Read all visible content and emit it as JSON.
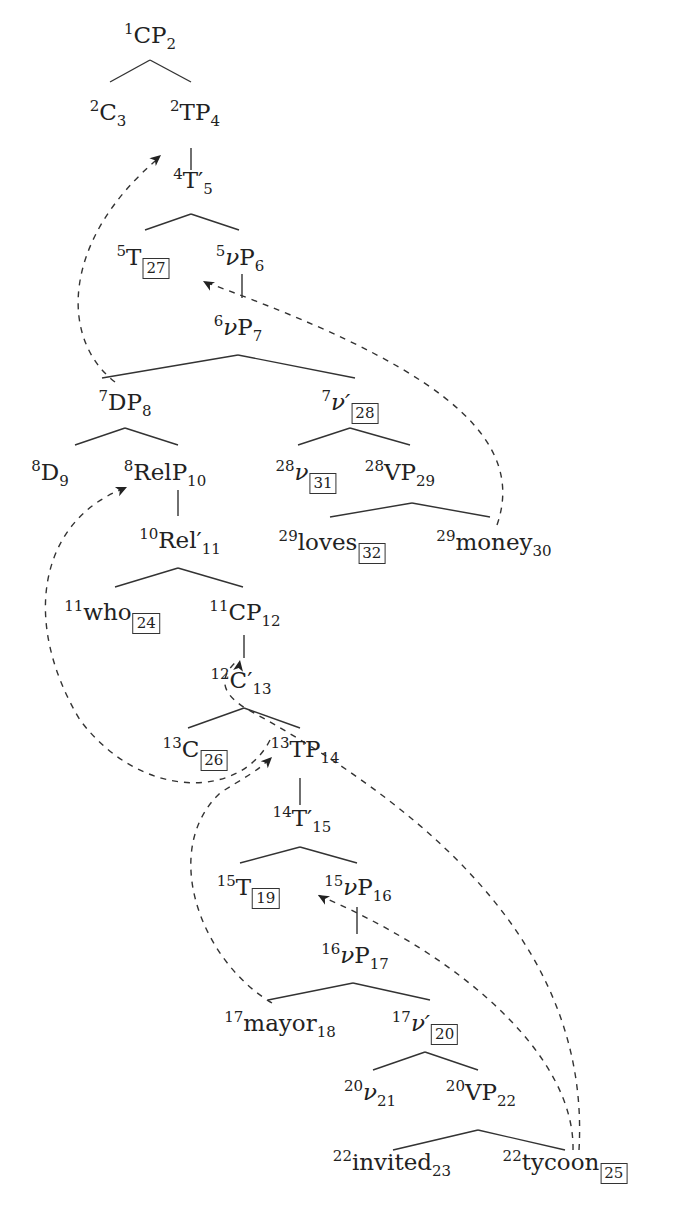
{
  "diagram": {
    "type": "syntax-tree",
    "nodes": [
      {
        "id": "n1",
        "left": "1",
        "label": "CP",
        "italic": false,
        "prime": false,
        "right": "2",
        "boxed": false,
        "x": 150,
        "y": 38
      },
      {
        "id": "n2",
        "left": "2",
        "label": "C",
        "italic": false,
        "prime": false,
        "right": "3",
        "boxed": false,
        "x": 108,
        "y": 115
      },
      {
        "id": "n3",
        "left": "2",
        "label": "TP",
        "italic": false,
        "prime": false,
        "right": "4",
        "boxed": false,
        "x": 195,
        "y": 115
      },
      {
        "id": "n4",
        "left": "4",
        "label": "T′",
        "italic": false,
        "prime": false,
        "right": "5",
        "boxed": false,
        "x": 193,
        "y": 183
      },
      {
        "id": "n5",
        "left": "5",
        "label": "T",
        "italic": false,
        "prime": false,
        "right": "27",
        "boxed": true,
        "x": 143,
        "y": 260
      },
      {
        "id": "n6",
        "left": "5",
        "label": "ν",
        "italic": true,
        "prime": false,
        "right": "",
        "suffix": "P",
        "sub2": "6",
        "boxed": false,
        "x": 240,
        "y": 260
      },
      {
        "id": "n7",
        "left": "6",
        "label": "ν",
        "italic": true,
        "prime": false,
        "right": "",
        "suffix": "P",
        "sub2": "7",
        "boxed": false,
        "x": 238,
        "y": 330
      },
      {
        "id": "n8",
        "left": "7",
        "label": "DP",
        "italic": false,
        "prime": false,
        "right": "8",
        "boxed": false,
        "x": 125,
        "y": 405
      },
      {
        "id": "n9",
        "left": "7",
        "label": "ν′",
        "italic": true,
        "prime": false,
        "right": "28",
        "boxed": true,
        "x": 350,
        "y": 405
      },
      {
        "id": "n10",
        "left": "8",
        "label": "D",
        "italic": false,
        "prime": false,
        "right": "9",
        "boxed": false,
        "x": 50,
        "y": 475
      },
      {
        "id": "n11",
        "left": "8",
        "label": "RelP",
        "italic": false,
        "prime": false,
        "right": "10",
        "boxed": false,
        "x": 165,
        "y": 475
      },
      {
        "id": "n12",
        "left": "28",
        "label": "ν",
        "italic": true,
        "prime": false,
        "right": "31",
        "boxed": true,
        "x": 306,
        "y": 475
      },
      {
        "id": "n13",
        "left": "28",
        "label": "VP",
        "italic": false,
        "prime": false,
        "right": "29",
        "boxed": false,
        "x": 400,
        "y": 475
      },
      {
        "id": "n14",
        "left": "10",
        "label": "Rel′",
        "italic": false,
        "prime": false,
        "right": "11",
        "boxed": false,
        "x": 180,
        "y": 543
      },
      {
        "id": "n15",
        "left": "29",
        "label": "loves",
        "italic": false,
        "prime": false,
        "right": "32",
        "boxed": true,
        "x": 332,
        "y": 545
      },
      {
        "id": "n16",
        "left": "29",
        "label": "money",
        "italic": false,
        "prime": false,
        "right": "30",
        "boxed": false,
        "x": 494,
        "y": 545
      },
      {
        "id": "n17",
        "left": "11",
        "label": "who",
        "italic": false,
        "prime": false,
        "right": "24",
        "boxed": true,
        "x": 112,
        "y": 615
      },
      {
        "id": "n18",
        "left": "11",
        "label": "CP",
        "italic": false,
        "prime": false,
        "right": "12",
        "boxed": false,
        "x": 245,
        "y": 615
      },
      {
        "id": "n19",
        "left": "12",
        "label": "C′",
        "italic": false,
        "prime": false,
        "right": "13",
        "boxed": false,
        "x": 241,
        "y": 683
      },
      {
        "id": "n20",
        "left": "13",
        "label": "C",
        "italic": false,
        "prime": false,
        "right": "26",
        "boxed": true,
        "x": 195,
        "y": 752
      },
      {
        "id": "n21",
        "left": "13",
        "label": "TP",
        "italic": false,
        "prime": false,
        "right": "14",
        "boxed": false,
        "x": 305,
        "y": 752
      },
      {
        "id": "n22",
        "left": "14",
        "label": "T′",
        "italic": false,
        "prime": false,
        "right": "15",
        "boxed": false,
        "x": 302,
        "y": 821
      },
      {
        "id": "n23",
        "left": "15",
        "label": "T",
        "italic": false,
        "prime": false,
        "right": "19",
        "boxed": true,
        "x": 248,
        "y": 890
      },
      {
        "id": "n24",
        "left": "15",
        "label": "ν",
        "italic": true,
        "prime": false,
        "right": "",
        "suffix": "P",
        "sub2": "16",
        "boxed": false,
        "x": 358,
        "y": 890
      },
      {
        "id": "n25",
        "left": "16",
        "label": "ν",
        "italic": true,
        "prime": false,
        "right": "",
        "suffix": "P",
        "sub2": "17",
        "boxed": false,
        "x": 355,
        "y": 958
      },
      {
        "id": "n26",
        "left": "17",
        "label": "mayor",
        "italic": false,
        "prime": false,
        "right": "18",
        "boxed": false,
        "x": 280,
        "y": 1026
      },
      {
        "id": "n27",
        "left": "17",
        "label": "ν′",
        "italic": true,
        "prime": false,
        "right": "20",
        "boxed": true,
        "x": 425,
        "y": 1026
      },
      {
        "id": "n28",
        "left": "20",
        "label": "ν",
        "italic": true,
        "prime": false,
        "right": "21",
        "boxed": false,
        "x": 370,
        "y": 1095
      },
      {
        "id": "n29",
        "left": "20",
        "label": "VP",
        "italic": false,
        "prime": false,
        "right": "22",
        "boxed": false,
        "x": 481,
        "y": 1095
      },
      {
        "id": "n30",
        "left": "22",
        "label": "invited",
        "italic": false,
        "prime": false,
        "right": "23",
        "boxed": false,
        "x": 392,
        "y": 1165
      },
      {
        "id": "n31",
        "left": "22",
        "label": "tycoon",
        "italic": false,
        "prime": false,
        "right": "25",
        "boxed": true,
        "x": 565,
        "y": 1165
      }
    ],
    "edges": [
      [
        110,
        82,
        150,
        60
      ],
      [
        150,
        60,
        191,
        82
      ],
      [
        191,
        148,
        191,
        170
      ],
      [
        145,
        230,
        191,
        214
      ],
      [
        191,
        214,
        239,
        230
      ],
      [
        242,
        274,
        242,
        298
      ],
      [
        102,
        378,
        238,
        355
      ],
      [
        238,
        355,
        355,
        378
      ],
      [
        75,
        445,
        125,
        428
      ],
      [
        125,
        428,
        178,
        445
      ],
      [
        298,
        445,
        350,
        428
      ],
      [
        350,
        428,
        410,
        445
      ],
      [
        178,
        490,
        178,
        516
      ],
      [
        330,
        517,
        412,
        503
      ],
      [
        412,
        503,
        490,
        517
      ],
      [
        115,
        587,
        178,
        568
      ],
      [
        178,
        568,
        243,
        587
      ],
      [
        244,
        635,
        244,
        658
      ],
      [
        188,
        728,
        244,
        708
      ],
      [
        244,
        708,
        300,
        728
      ],
      [
        300,
        778,
        300,
        805
      ],
      [
        240,
        863,
        300,
        847
      ],
      [
        300,
        847,
        357,
        863
      ],
      [
        357,
        907,
        357,
        934
      ],
      [
        268,
        1000,
        353,
        983
      ],
      [
        353,
        983,
        430,
        1000
      ],
      [
        373,
        1070,
        425,
        1052
      ],
      [
        425,
        1052,
        478,
        1070
      ],
      [
        393,
        1150,
        478,
        1130
      ],
      [
        478,
        1130,
        565,
        1150
      ]
    ],
    "movement_arrows": [
      {
        "from": "DP8",
        "to": "TP4",
        "path": "M 115 382 C 60 340, 60 240, 160 157"
      },
      {
        "from": "money30",
        "to": "vP6",
        "path": "M 497 525 C 530 430, 420 360, 205 282"
      },
      {
        "from": "RelP10",
        "to": "who24-chain",
        "path": "M 270 740 C 240 800, 140 800, 80 720 C 20 620, 40 520, 125 488"
      },
      {
        "from": "tycoon25",
        "to": "CP12",
        "path": "M 579 1150 C 590 960, 450 820, 245 708 C 225 695, 215 680, 238 660"
      },
      {
        "from": "mayor18",
        "to": "TP14",
        "path": "M 272 1003 C 200 960, 160 850, 220 793 C 240 780, 260 770, 270 758"
      },
      {
        "from": "tycoon25-b",
        "to": "vP16",
        "path": "M 573 1150 C 575 1060, 470 960, 318 895"
      }
    ],
    "arrowheads": [
      {
        "x": 161,
        "y": 155,
        "angle": -40
      },
      {
        "x": 203,
        "y": 281,
        "angle": -150
      },
      {
        "x": 127,
        "y": 487,
        "angle": -25
      },
      {
        "x": 240,
        "y": 660,
        "angle": -80
      },
      {
        "x": 272,
        "y": 757,
        "angle": -45
      },
      {
        "x": 318,
        "y": 895,
        "angle": -150
      }
    ]
  }
}
